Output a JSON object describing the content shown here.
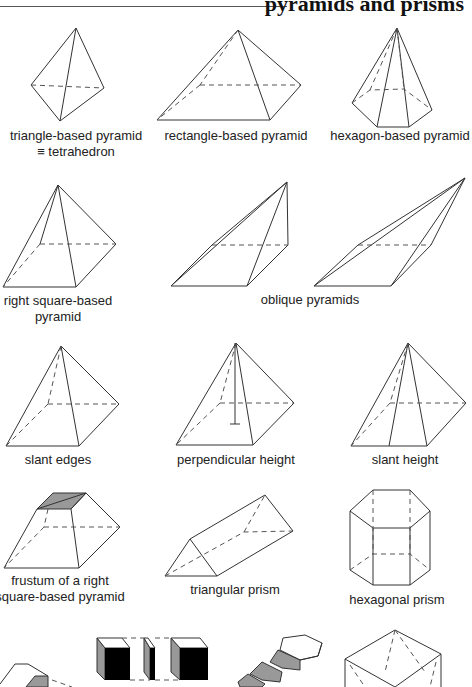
{
  "header": {
    "title": "pyramids and prisms"
  },
  "figures": [
    {
      "id": "triangle-based-pyramid",
      "label_line1": "triangle-based pyramid",
      "label_line2": "≡ tetrahedron"
    },
    {
      "id": "rectangle-based-pyramid",
      "label_line1": "rectangle-based pyramid"
    },
    {
      "id": "hexagon-based-pyramid",
      "label_line1": "hexagon-based pyramid"
    },
    {
      "id": "right-square-based-pyramid",
      "label_line1": "right square-based",
      "label_line2": "pyramid"
    },
    {
      "id": "oblique-pyramids",
      "label_line1": "oblique pyramids"
    },
    {
      "id": "slant-edges",
      "label_line1": "slant edges"
    },
    {
      "id": "perpendicular-height",
      "label_line1": "perpendicular height"
    },
    {
      "id": "slant-height",
      "label_line1": "slant height"
    },
    {
      "id": "frustum",
      "label_line1": "frustum of a right",
      "label_line2": "square-based pyramid"
    },
    {
      "id": "triangular-prism",
      "label_line1": "triangular prism"
    },
    {
      "id": "hexagonal-prism",
      "label_line1": "hexagonal prism"
    }
  ],
  "colors": {
    "line": "#333333",
    "shade": "#999999",
    "background": "#ffffff"
  }
}
